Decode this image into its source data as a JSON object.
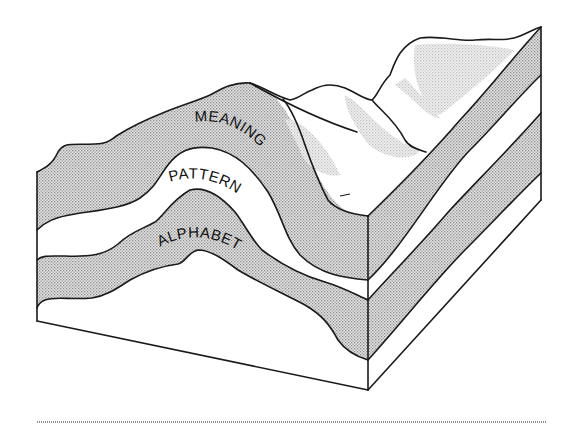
{
  "figure": {
    "type": "block-diagram",
    "layers": [
      {
        "id": "meaning",
        "label": "MEANING",
        "order": 1,
        "fill": "shaded"
      },
      {
        "id": "pattern",
        "label": "PATTERN",
        "order": 2,
        "fill": "white"
      },
      {
        "id": "alphabet",
        "label": "ALPHABET",
        "order": 3,
        "fill": "shaded"
      }
    ],
    "colors": {
      "ink": "#1a1a1a",
      "shade": "#c9c9c9",
      "light_shade": "#dedede",
      "paper": "#ffffff"
    }
  }
}
